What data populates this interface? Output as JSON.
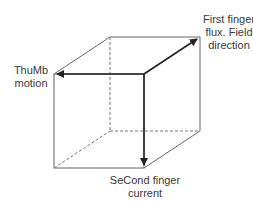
{
  "diagram": {
    "type": "cube-vector-diagram",
    "labels": {
      "first_finger": [
        "First finger",
        "flux. Field",
        "direction"
      ],
      "thumb": [
        "ThuMb",
        "motion"
      ],
      "second_finger": [
        "SeCond finger",
        "current"
      ]
    },
    "colors": {
      "edge": "#555555",
      "arrow": "#222222"
    }
  }
}
